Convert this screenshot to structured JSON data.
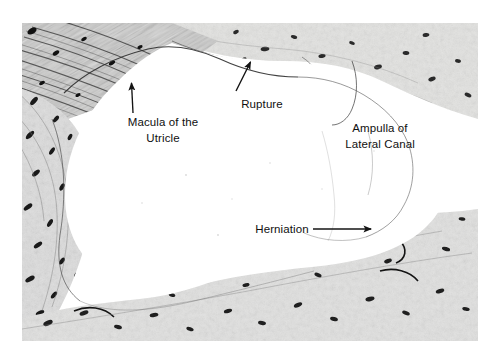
{
  "figure": {
    "kind": "histology-micrograph",
    "background_color": "#ffffff",
    "ink_color": "#101010"
  },
  "annotations": [
    {
      "id": "macula",
      "name": "macula-label",
      "lines": [
        "Macula of the",
        "Utricle"
      ],
      "x": 110,
      "y": 117,
      "arrow": {
        "x1": 133,
        "y1": 112,
        "x2": 131,
        "y2": 85,
        "head": "up"
      }
    },
    {
      "id": "rupture",
      "name": "rupture-label",
      "lines": [
        "Rupture"
      ],
      "x": 232,
      "y": 97,
      "arrow": {
        "x1": 237,
        "y1": 92,
        "x2": 250,
        "y2": 62,
        "head": "up-right"
      }
    },
    {
      "id": "ampulla",
      "name": "ampulla-label",
      "lines": [
        "Ampulla of",
        "Lateral Canal"
      ],
      "x": 337,
      "y": 123,
      "arrow": null
    },
    {
      "id": "herniation",
      "name": "herniation-label",
      "lines": [
        "Herniation"
      ],
      "x": 253,
      "y": 222,
      "arrow": {
        "x1": 314,
        "y1": 229,
        "x2": 372,
        "y2": 229,
        "head": "right"
      }
    }
  ],
  "regions": [
    {
      "name": "fibrous-tissue-upper-left",
      "tone": "dark-striated"
    },
    {
      "name": "bone-tissue-left-margin",
      "tone": "mid-gray-lacunae"
    },
    {
      "name": "bone-tissue-upper-right",
      "tone": "light-gray-lacunae"
    },
    {
      "name": "bone-tissue-lower",
      "tone": "light-gray-lacunae"
    },
    {
      "name": "endolymphatic-cavity",
      "tone": "white"
    },
    {
      "name": "utricular-membrane",
      "tone": "thin-dark-line"
    }
  ]
}
